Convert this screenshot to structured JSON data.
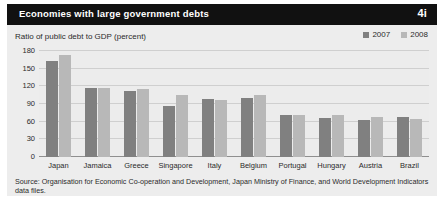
{
  "header": {
    "title": "Economies with large government debts",
    "number": "4i"
  },
  "chart_data": {
    "type": "bar",
    "title": "Economies with large government debts",
    "subtitle": "Ratio of public debt to GDP (percent)",
    "xlabel": "",
    "ylabel": "Ratio of public debt to GDP (percent)",
    "ylim": [
      0,
      180
    ],
    "yticks": [
      0,
      30,
      60,
      90,
      120,
      150,
      180
    ],
    "ytick_labels": [
      "0",
      "30",
      "60",
      "90",
      "120",
      "150",
      "180"
    ],
    "grid": true,
    "legend_position": "top-right",
    "categories": [
      "Japan",
      "Jamaica",
      "Greece",
      "Singapore",
      "Italy",
      "Belgium",
      "Portugal",
      "Hungary",
      "Austria",
      "Brazil"
    ],
    "series": [
      {
        "name": "2007",
        "color": "#808080",
        "values": [
          163,
          117,
          112,
          87,
          99,
          101,
          71,
          66,
          63,
          68
        ]
      },
      {
        "name": "2008",
        "color": "#b8b8b8",
        "values": [
          173,
          117,
          115,
          105,
          97,
          106,
          72,
          72,
          68,
          65
        ]
      }
    ]
  },
  "source": {
    "text": "Source: Organisation for Economic Co-operation and Development, Japan Ministry of Finance, and World Development Indicators data files."
  },
  "colors": {
    "header_bg": "#111111",
    "header_text": "#ffffff",
    "panel_bg": "#ededed",
    "plot_bg": "#ececec",
    "gridline": "#cfcfcf",
    "axis": "#8f8f8f",
    "text": "#2b2b2b"
  }
}
